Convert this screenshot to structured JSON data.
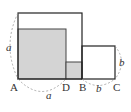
{
  "diagram": {
    "points": {
      "A": "A",
      "D": "D",
      "B": "B",
      "C": "C"
    },
    "lengths": {
      "a_left": "a",
      "a_bottom": "a",
      "b_bottom": "b",
      "b_right": "b"
    },
    "colors": {
      "stroke": "#222222",
      "fill_gray": "#d4d4d4",
      "dash": "#999999"
    }
  }
}
